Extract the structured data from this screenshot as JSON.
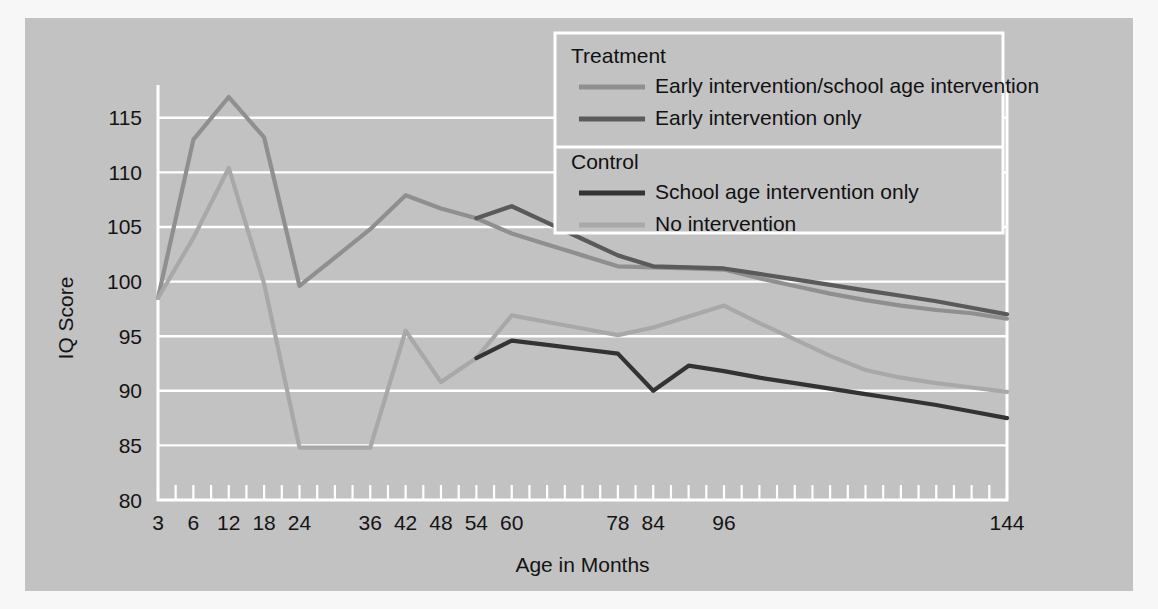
{
  "chart_data": {
    "type": "line",
    "title": "",
    "xlabel": "Age in Months",
    "ylabel": "IQ Score",
    "ylim": [
      80,
      118
    ],
    "yticks": [
      80,
      85,
      90,
      95,
      100,
      105,
      110,
      115
    ],
    "grid": true,
    "x": [
      3,
      6,
      12,
      18,
      24,
      30,
      36,
      42,
      48,
      54,
      60,
      66,
      72,
      78,
      84,
      90,
      96,
      102,
      108,
      114,
      120,
      126,
      132,
      138,
      144
    ],
    "xtick_labels": [
      "3",
      "6",
      "12",
      "18",
      "24",
      "",
      "36",
      "42",
      "48",
      "54",
      "60",
      "",
      "",
      "78",
      "84",
      "",
      "96",
      "",
      "",
      "",
      "",
      "",
      "",
      "",
      "144"
    ],
    "legend_position": "top-center",
    "series": [
      {
        "name": "Early intervention/school age intervention",
        "group": "Treatment",
        "color": "#8f8f8f",
        "x": [
          3,
          6,
          12,
          18,
          24,
          30,
          36,
          42,
          48,
          54,
          60,
          66,
          72,
          78,
          84,
          90,
          96,
          102,
          108,
          114,
          120,
          126,
          132,
          138,
          144
        ],
        "values": [
          98.5,
          113.0,
          116.9,
          113.2,
          99.6,
          102.2,
          104.8,
          107.9,
          106.7,
          105.8,
          104.4,
          103.4,
          102.4,
          101.4,
          101.3,
          101.2,
          101.1,
          100.3,
          99.6,
          98.9,
          98.3,
          97.8,
          97.4,
          97.1,
          96.6
        ]
      },
      {
        "name": "Early intervention only",
        "group": "Treatment",
        "color": "#5a5a5a",
        "x": [
          54,
          60,
          66,
          72,
          78,
          84,
          90,
          96,
          102,
          108,
          114,
          120,
          126,
          132,
          138,
          144
        ],
        "values": [
          105.8,
          106.9,
          105.4,
          103.9,
          102.4,
          101.4,
          101.3,
          101.2,
          100.7,
          100.2,
          99.7,
          99.2,
          98.7,
          98.2,
          97.6,
          97.0
        ]
      },
      {
        "name": "School age intervention only",
        "group": "Control",
        "color": "#333333",
        "x": [
          54,
          60,
          66,
          72,
          78,
          84,
          90,
          96,
          102,
          108,
          114,
          120,
          126,
          132,
          138,
          144
        ],
        "values": [
          93.0,
          94.6,
          94.2,
          93.8,
          93.4,
          90.0,
          92.3,
          91.8,
          91.2,
          90.7,
          90.2,
          89.7,
          89.2,
          88.7,
          88.1,
          87.5
        ]
      },
      {
        "name": "No intervention",
        "group": "Control",
        "color": "#a8a8a8",
        "x": [
          3,
          6,
          12,
          18,
          24,
          30,
          36,
          42,
          48,
          54,
          60,
          66,
          72,
          78,
          84,
          90,
          96,
          102,
          108,
          114,
          120,
          126,
          132,
          138,
          144
        ],
        "values": [
          98.5,
          104.0,
          110.4,
          99.8,
          84.8,
          84.8,
          84.8,
          95.5,
          90.8,
          93.0,
          96.9,
          96.3,
          95.7,
          95.1,
          95.8,
          96.8,
          97.8,
          96.2,
          94.7,
          93.2,
          91.9,
          91.2,
          90.7,
          90.3,
          89.9
        ]
      }
    ]
  },
  "legend": {
    "groups": [
      {
        "heading": "Treatment",
        "entries": [
          {
            "label": "Early intervention/school age intervention",
            "color": "#8f8f8f"
          },
          {
            "label": "Early intervention only",
            "color": "#5a5a5a"
          }
        ]
      },
      {
        "heading": "Control",
        "entries": [
          {
            "label": "School age intervention only",
            "color": "#333333"
          },
          {
            "label": "No intervention",
            "color": "#a8a8a8"
          }
        ]
      }
    ]
  },
  "colors": {
    "figure_background": "#c2c2c2",
    "page_background": "#f7f7f7",
    "grid": "#ffffff",
    "text": "#141414"
  }
}
